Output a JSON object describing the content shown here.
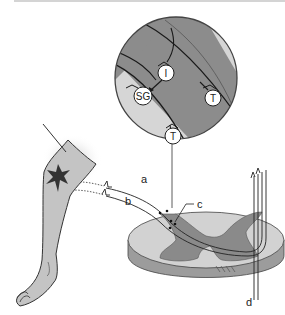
{
  "diagram": {
    "type": "neuroanatomy illustration",
    "magnified_view": {
      "neurons": [
        {
          "id": "I",
          "label": "I"
        },
        {
          "id": "SG",
          "label": "SG"
        },
        {
          "id": "T_right",
          "label": "T"
        },
        {
          "id": "T_bottom",
          "label": "T"
        }
      ]
    },
    "pathway_labels": {
      "a": "a",
      "b": "b",
      "c": "c",
      "d": "d"
    },
    "colors": {
      "grey_matter": "#8a8a8a",
      "white_matter": "#d2d2d2",
      "cord_side": "#9c9c9c",
      "leg_fill": "#c4c4c4",
      "outline": "#333333",
      "neuron_fill": "#ffffff"
    }
  }
}
